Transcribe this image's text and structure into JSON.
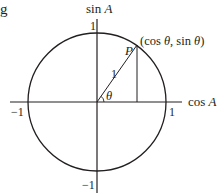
{
  "diagram": {
    "type": "unit-circle",
    "stroke_color": "#231f20",
    "background": "#ffffff",
    "fragment_text": "g",
    "axes": {
      "y_label": "sin A",
      "x_label": "cos A",
      "y_label_func": "sin",
      "y_label_var": "A",
      "x_label_func": "cos",
      "x_label_var": "A"
    },
    "ticks": {
      "top": "1",
      "bottom": "−1",
      "left": "−1",
      "right": "1"
    },
    "point": {
      "name": "P",
      "coord_label": "(cos θ, sin θ)",
      "coord_open": "(cos ",
      "theta1": "θ",
      "coord_mid": ", sin ",
      "theta2": "θ",
      "coord_close": ")"
    },
    "radius_label": "1",
    "angle_label": "θ",
    "angle_degrees_approx": 55
  }
}
